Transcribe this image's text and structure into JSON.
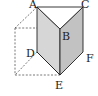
{
  "diagram": {
    "type": "triangular-prism-in-cube",
    "vertices": {
      "A": {
        "label": "A",
        "x": 37,
        "y": 7
      },
      "B": {
        "label": "B",
        "x": 60,
        "y": 29
      },
      "C": {
        "label": "C",
        "x": 83,
        "y": 7
      },
      "D": {
        "label": "D",
        "x": 37,
        "y": 52
      },
      "E": {
        "label": "E",
        "x": 60,
        "y": 75
      },
      "F": {
        "label": "F",
        "x": 83,
        "y": 52
      }
    },
    "colors": {
      "face_left": "#d4d4d4",
      "face_right": "#bdbdbd",
      "face_top": "#ffffff",
      "stroke": "#222222",
      "dashed": "#555555"
    }
  }
}
